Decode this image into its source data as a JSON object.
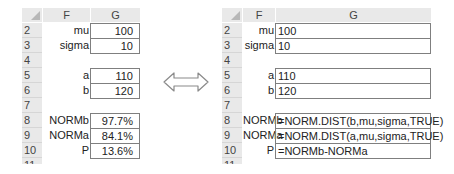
{
  "left_sheet": {
    "columns": [
      "F",
      "G"
    ],
    "rows": [
      {
        "num": "2",
        "label": "mu",
        "value": "100",
        "boxed": true
      },
      {
        "num": "3",
        "label": "sigma",
        "value": "10",
        "boxed": true
      },
      {
        "num": "4",
        "label": "",
        "value": "",
        "boxed": false
      },
      {
        "num": "5",
        "label": "a",
        "value": "110",
        "boxed": true
      },
      {
        "num": "6",
        "label": "b",
        "value": "120",
        "boxed": true
      },
      {
        "num": "7",
        "label": "",
        "value": "",
        "boxed": false
      },
      {
        "num": "8",
        "label": "NORMb",
        "value": "97.7%",
        "boxed": true
      },
      {
        "num": "9",
        "label": "NORMa",
        "value": "84.1%",
        "boxed": true
      },
      {
        "num": "10",
        "label": "P",
        "value": "13.6%",
        "boxed": true
      },
      {
        "num": "11",
        "label": "",
        "value": "",
        "boxed": false
      }
    ]
  },
  "arrow": {
    "icon": "double-arrow-icon",
    "color": "#8a8a8a"
  },
  "right_sheet": {
    "columns": [
      "F",
      "G"
    ],
    "rows": [
      {
        "num": "2",
        "label": "mu",
        "value": "100",
        "boxed": true
      },
      {
        "num": "3",
        "label": "sigma",
        "value": "10",
        "boxed": true
      },
      {
        "num": "4",
        "label": "",
        "value": "",
        "boxed": false
      },
      {
        "num": "5",
        "label": "a",
        "value": "110",
        "boxed": true
      },
      {
        "num": "6",
        "label": "b",
        "value": "120",
        "boxed": true
      },
      {
        "num": "7",
        "label": "",
        "value": "",
        "boxed": false
      },
      {
        "num": "8",
        "label": "NORMb",
        "value": "=NORM.DIST(b,mu,sigma,TRUE)",
        "boxed": true
      },
      {
        "num": "9",
        "label": "NORMa",
        "value": "=NORM.DIST(a,mu,sigma,TRUE)",
        "boxed": true
      },
      {
        "num": "10",
        "label": "P",
        "value": "=NORMb-NORMa",
        "boxed": true
      },
      {
        "num": "11",
        "label": "",
        "value": "",
        "boxed": false
      }
    ]
  }
}
